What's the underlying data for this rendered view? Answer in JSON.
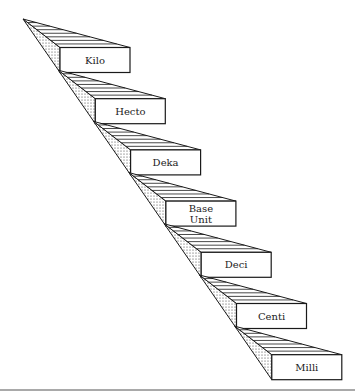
{
  "diagram": {
    "type": "staircase",
    "steps": [
      {
        "label": "Kilo",
        "lines": [
          "Kilo"
        ]
      },
      {
        "label": "Hecto",
        "lines": [
          "Hecto"
        ]
      },
      {
        "label": "Deka",
        "lines": [
          "Deka"
        ]
      },
      {
        "label": "Base Unit",
        "lines": [
          "Base",
          "Unit"
        ]
      },
      {
        "label": "Deci",
        "lines": [
          "Deci"
        ]
      },
      {
        "label": "Centi",
        "lines": [
          "Centi"
        ]
      },
      {
        "label": "Milli",
        "lines": [
          "Milli"
        ]
      }
    ],
    "colors": {
      "ink": "#1a1a1a",
      "background": "#ffffff"
    }
  }
}
